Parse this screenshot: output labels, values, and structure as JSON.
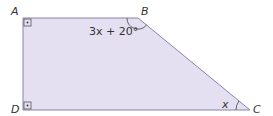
{
  "diagram": {
    "shape": "right trapezoid",
    "fill_color": "#e4e0f2",
    "stroke_color": "#8a82a8",
    "vertices": {
      "A": {
        "label": "A",
        "x": 23,
        "y": 18
      },
      "B": {
        "label": "B",
        "x": 138,
        "y": 18
      },
      "C": {
        "label": "C",
        "x": 250,
        "y": 110
      },
      "D": {
        "label": "D",
        "x": 23,
        "y": 110
      }
    },
    "angle_labels": {
      "B": "3x + 20°",
      "C": "x"
    },
    "right_angles": [
      "A",
      "D"
    ]
  }
}
